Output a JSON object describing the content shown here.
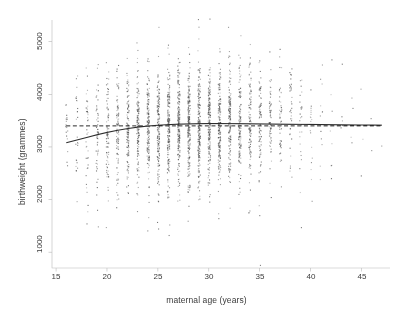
{
  "figure": {
    "background_color": "#ffffff",
    "axis_color": "#b9b9b9",
    "text_color": "#3b3b3b",
    "point_color": "#555555",
    "curve_color": "#2b2b2b",
    "plot_area": {
      "left": 52,
      "right": 390,
      "top": 18,
      "bottom": 268
    }
  },
  "chart_data": {
    "type": "scatter",
    "title": "",
    "xlabel": "maternal age (years)",
    "ylabel": "birthweight (grammes)",
    "xlim": [
      14.6,
      47.8
    ],
    "ylim": [
      700,
      5450
    ],
    "grid": false,
    "legend": "none",
    "xticks": [
      15,
      20,
      25,
      30,
      35,
      40,
      45
    ],
    "yticks": [
      1000,
      2000,
      3000,
      4000,
      5000
    ],
    "xtick_labels": [
      "15",
      "20",
      "25",
      "30",
      "35",
      "40",
      "45"
    ],
    "ytick_labels": [
      "1000",
      "2000",
      "3000",
      "4000",
      "5000"
    ],
    "point_marker": ".",
    "point_size": 1.1,
    "series": [
      {
        "name": "observations",
        "type": "scatter",
        "note": "one vertical strip of births per integer maternal age; counts peak near age 27-30",
        "x": [
          16,
          17,
          18,
          19,
          20,
          21,
          22,
          23,
          24,
          25,
          26,
          27,
          28,
          29,
          30,
          31,
          32,
          33,
          34,
          35,
          36,
          37,
          38,
          39,
          40,
          41,
          42,
          43,
          44,
          45,
          46,
          47
        ],
        "counts": [
          18,
          26,
          40,
          58,
          78,
          98,
          120,
          140,
          158,
          176,
          190,
          200,
          205,
          200,
          190,
          172,
          152,
          130,
          108,
          86,
          66,
          50,
          36,
          26,
          18,
          12,
          8,
          6,
          4,
          3,
          2,
          1
        ],
        "mean_y": [
          3190,
          3230,
          3265,
          3300,
          3330,
          3355,
          3380,
          3400,
          3415,
          3425,
          3432,
          3438,
          3440,
          3442,
          3440,
          3438,
          3436,
          3434,
          3432,
          3430,
          3428,
          3426,
          3424,
          3422,
          3420,
          3418,
          3416,
          3414,
          3412,
          3410,
          3408,
          3406
        ],
        "sd_y": [
          540,
          545,
          548,
          550,
          552,
          553,
          554,
          555,
          556,
          556,
          557,
          557,
          558,
          558,
          558,
          559,
          559,
          560,
          560,
          561,
          561,
          562,
          562,
          563,
          563,
          564,
          564,
          565,
          565,
          566,
          566,
          567
        ]
      },
      {
        "name": "smooth-fit",
        "type": "line",
        "style": "solid",
        "x": [
          16,
          17,
          18,
          19,
          20,
          21,
          22,
          23,
          24,
          25,
          26,
          27,
          28,
          29,
          30,
          31,
          32,
          33,
          34,
          35,
          36,
          37,
          38,
          39,
          40,
          41,
          42,
          43,
          44,
          45,
          46,
          47
        ],
        "y": [
          3080,
          3130,
          3180,
          3230,
          3275,
          3315,
          3348,
          3375,
          3396,
          3412,
          3424,
          3432,
          3438,
          3442,
          3444,
          3444,
          3443,
          3441,
          3439,
          3437,
          3435,
          3433,
          3431,
          3429,
          3427,
          3425,
          3423,
          3421,
          3419,
          3417,
          3415,
          3413
        ]
      },
      {
        "name": "constant-mean",
        "type": "line",
        "style": "dashed",
        "x": [
          16,
          47
        ],
        "y": [
          3400,
          3400
        ]
      }
    ]
  }
}
